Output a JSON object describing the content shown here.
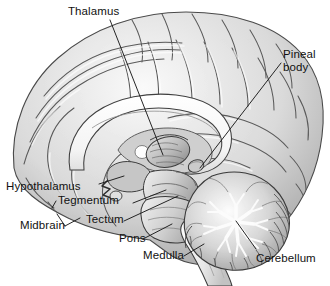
{
  "figure": {
    "background_color": "#ffffff",
    "label_color": "#111111",
    "leader_line_color": "#1a1a1a",
    "width": 330,
    "height": 286
  },
  "labels": {
    "thalamus": "Thalamus",
    "pineal_body": "Pineal\nbody",
    "hypothalamus": "Hypothalamus",
    "tegmentum": "Tegmentum",
    "midbrain": "Midbrain",
    "tectum": "Tectum",
    "pons": "Pons",
    "medulla": "Medulla",
    "cerebellum": "Cerebellum"
  },
  "structures": [
    {
      "name": "cerebral-cortex",
      "label": "",
      "fill": "#d9d9d9"
    },
    {
      "name": "corpus-callosum",
      "label": "",
      "fill": "#fbfbfb"
    },
    {
      "name": "thalamus",
      "label": "Thalamus",
      "fill": "#b7b7b7"
    },
    {
      "name": "pineal-body",
      "label": "Pineal body",
      "fill": "#c9c9c9"
    },
    {
      "name": "hypothalamus",
      "label": "Hypothalamus",
      "fill": "#c4c4c4"
    },
    {
      "name": "tectum",
      "label": "Tectum",
      "fill": "#b0b0b0"
    },
    {
      "name": "tegmentum",
      "label": "Tegmentum",
      "fill": "#bdbdbd"
    },
    {
      "name": "midbrain",
      "label": "Midbrain",
      "fill": "#b5b5b5"
    },
    {
      "name": "pons",
      "label": "Pons",
      "fill": "#cfcfcf"
    },
    {
      "name": "medulla",
      "label": "Medulla",
      "fill": "#e3e3e3"
    },
    {
      "name": "cerebellum",
      "label": "Cerebellum",
      "fill": "#cacaca"
    }
  ],
  "label_positions": {
    "thalamus": {
      "x": 68,
      "y": 5,
      "align": "left"
    },
    "pineal_body": {
      "x": 283,
      "y": 48,
      "align": "left"
    },
    "hypothalamus": {
      "x": 6,
      "y": 180,
      "align": "left"
    },
    "tegmentum": {
      "x": 58,
      "y": 201,
      "align": "left"
    },
    "midbrain": {
      "x": 20,
      "y": 219,
      "align": "left"
    },
    "tectum": {
      "x": 86,
      "y": 219,
      "align": "left"
    },
    "pons": {
      "x": 119,
      "y": 236,
      "align": "left"
    },
    "medulla": {
      "x": 143,
      "y": 253,
      "align": "left"
    },
    "cerebellum": {
      "x": 256,
      "y": 258,
      "align": "left"
    }
  }
}
